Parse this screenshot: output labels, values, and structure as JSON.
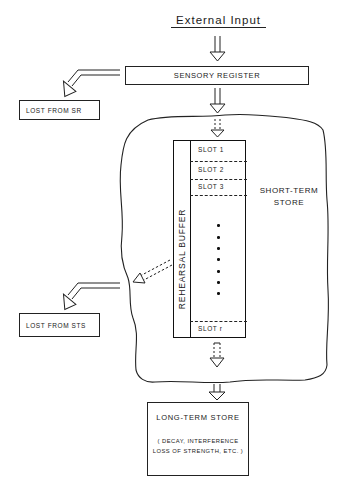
{
  "diagram": {
    "input": {
      "label": "External Input"
    },
    "sensory_register": {
      "label": "SENSORY REGISTER"
    },
    "lost_from_sr": {
      "label": "LOST FROM SR"
    },
    "short_term_store": {
      "label_line1": "SHORT-TERM",
      "label_line2": "STORE",
      "rehearsal_buffer": {
        "label": "REHEARSAL BUFFER",
        "slots": [
          "SLOT 1",
          "SLOT 2",
          "SLOT 3",
          "SLOT r"
        ],
        "ellipsis_dots": 7
      }
    },
    "lost_from_sts": {
      "label": "LOST FROM STS"
    },
    "long_term_store": {
      "label": "LONG-TERM STORE",
      "note_line1": "( DECAY, INTERFERENCE",
      "note_line2": "LOSS OF STRENGTH, ETC. )"
    },
    "arrows": [
      {
        "from": "External Input",
        "to": "SENSORY REGISTER",
        "style": "solid"
      },
      {
        "from": "SENSORY REGISTER",
        "to": "LOST FROM SR",
        "style": "solid"
      },
      {
        "from": "SENSORY REGISTER",
        "to": "SHORT-TERM STORE",
        "style": "solid"
      },
      {
        "from": "SHORT-TERM STORE entry",
        "to": "REHEARSAL BUFFER",
        "style": "dashed"
      },
      {
        "from": "REHEARSAL BUFFER",
        "to": "STS boundary",
        "style": "dashed"
      },
      {
        "from": "SHORT-TERM STORE",
        "to": "LOST FROM STS",
        "style": "solid"
      },
      {
        "from": "REHEARSAL BUFFER",
        "to": "STS bottom",
        "style": "dashed"
      },
      {
        "from": "SHORT-TERM STORE",
        "to": "LONG-TERM STORE",
        "style": "solid"
      }
    ]
  }
}
